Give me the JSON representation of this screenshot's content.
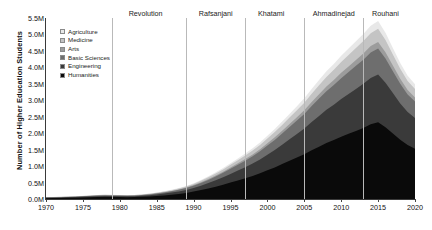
{
  "chart_data": {
    "type": "area",
    "stacked": true,
    "title": "",
    "xlabel": "",
    "ylabel": "Number of Higher Education Students",
    "xlim": [
      1970,
      2020
    ],
    "ylim": [
      0,
      5500000
    ],
    "ytick_labels": [
      "0.0M",
      "0.5M",
      "1.0M",
      "1.5M",
      "2.0M",
      "2.5M",
      "3.0M",
      "3.5M",
      "4.0M",
      "4.5M",
      "5.0M",
      "5.5M"
    ],
    "ytick_values": [
      0,
      500000,
      1000000,
      1500000,
      2000000,
      2500000,
      3000000,
      3500000,
      4000000,
      4500000,
      5000000,
      5500000
    ],
    "xtick_labels": [
      "1970",
      "1975",
      "1980",
      "1985",
      "1990",
      "1995",
      "2000",
      "2005",
      "2010",
      "2015",
      "2020"
    ],
    "xtick_values": [
      1970,
      1975,
      1980,
      1985,
      1990,
      1995,
      2000,
      2005,
      2010,
      2015,
      2020
    ],
    "grid": false,
    "legend_position": "upper-left",
    "x": [
      1970,
      1971,
      1972,
      1973,
      1974,
      1975,
      1976,
      1977,
      1978,
      1979,
      1980,
      1981,
      1982,
      1983,
      1984,
      1985,
      1986,
      1987,
      1988,
      1989,
      1990,
      1991,
      1992,
      1993,
      1994,
      1995,
      1996,
      1997,
      1998,
      1999,
      2000,
      2001,
      2002,
      2003,
      2004,
      2005,
      2006,
      2007,
      2008,
      2009,
      2010,
      2011,
      2012,
      2013,
      2014,
      2015,
      2016,
      2017,
      2018,
      2019,
      2020
    ],
    "series": [
      {
        "name": "Humanities",
        "color": "#0a0a0a",
        "values": [
          25000,
          28000,
          32000,
          36000,
          41000,
          46000,
          52000,
          58000,
          62000,
          60000,
          58000,
          55000,
          58000,
          66000,
          78000,
          92000,
          110000,
          130000,
          155000,
          185000,
          225000,
          270000,
          320000,
          375000,
          435000,
          500000,
          565000,
          630000,
          700000,
          780000,
          870000,
          960000,
          1060000,
          1160000,
          1260000,
          1360000,
          1480000,
          1590000,
          1700000,
          1790000,
          1890000,
          1980000,
          2070000,
          2160000,
          2270000,
          2330000,
          2180000,
          1990000,
          1800000,
          1640000,
          1530000
        ]
      },
      {
        "name": "Engineering",
        "color": "#3a3a3a",
        "values": [
          12000,
          13000,
          15000,
          17000,
          19000,
          22000,
          25000,
          28000,
          30000,
          29000,
          28000,
          27000,
          28000,
          32000,
          38000,
          45000,
          54000,
          64000,
          76000,
          92000,
          112000,
          136000,
          163000,
          193000,
          226000,
          262000,
          299000,
          337000,
          378000,
          424000,
          476000,
          530000,
          590000,
          652000,
          716000,
          782000,
          860000,
          935000,
          1010000,
          1075000,
          1145000,
          1210000,
          1275000,
          1340000,
          1410000,
          1450000,
          1355000,
          1230000,
          1105000,
          1000000,
          930000
        ]
      },
      {
        "name": "Basic Sciences",
        "color": "#6e6e6e",
        "values": [
          8000,
          8500,
          9500,
          10500,
          12000,
          13500,
          15500,
          17500,
          18500,
          18000,
          17500,
          17000,
          17500,
          20000,
          23500,
          28000,
          33500,
          39500,
          47000,
          56000,
          68000,
          82000,
          98000,
          115000,
          134000,
          155000,
          176000,
          198000,
          221000,
          247000,
          276000,
          306000,
          339000,
          373000,
          408000,
          444000,
          486000,
          527000,
          566000,
          600000,
          637000,
          670000,
          703000,
          735000,
          770000,
          790000,
          735000,
          665000,
          595000,
          538000,
          500000
        ]
      },
      {
        "name": "Arts",
        "color": "#9c9c9c",
        "values": [
          2000,
          2200,
          2400,
          2700,
          3000,
          3400,
          3900,
          4400,
          4700,
          4600,
          4500,
          4400,
          4500,
          5100,
          6000,
          7100,
          8500,
          10000,
          12000,
          14300,
          17300,
          20800,
          24800,
          29200,
          34000,
          39300,
          44700,
          50200,
          56100,
          62600,
          70000,
          77600,
          85900,
          94600,
          103500,
          112600,
          123300,
          133700,
          143600,
          152200,
          161600,
          170000,
          178400,
          186500,
          195400,
          200400,
          186500,
          168700,
          151000,
          136500,
          127000
        ]
      },
      {
        "name": "Medicine",
        "color": "#c4c4c4",
        "values": [
          5000,
          5400,
          5900,
          6500,
          7200,
          8000,
          9000,
          10000,
          10500,
          10200,
          9900,
          9600,
          9900,
          11200,
          13100,
          15400,
          18400,
          21600,
          25700,
          30600,
          36800,
          44100,
          52300,
          61300,
          71200,
          82000,
          93000,
          104200,
          116000,
          129200,
          144000,
          159300,
          176000,
          193400,
          211200,
          229300,
          250600,
          271300,
          291200,
          308200,
          326800,
          343500,
          360000,
          376200,
          393900,
          403700,
          375700,
          339600,
          303700,
          274300,
          255000
        ]
      },
      {
        "name": "Agriculture",
        "color": "#e8e8e8",
        "values": [
          3000,
          3200,
          3500,
          3900,
          4300,
          4800,
          5400,
          6000,
          6400,
          6200,
          6000,
          5800,
          6000,
          6800,
          7900,
          9300,
          11100,
          13000,
          15400,
          18300,
          22000,
          26300,
          31100,
          36400,
          42200,
          48600,
          55000,
          61600,
          68400,
          76100,
          84700,
          93500,
          103200,
          113200,
          123400,
          133800,
          146000,
          157900,
          169300,
          179000,
          189600,
          199100,
          208400,
          217400,
          227500,
          233000,
          216700,
          195700,
          174800,
          157800,
          146500
        ]
      }
    ],
    "eras": [
      {
        "label": "Revolution",
        "line_year": 1979,
        "label_year": 1983.5
      },
      {
        "label": "Rafsanjani",
        "line_year": 1989,
        "label_year": 1993
      },
      {
        "label": "Khatami",
        "line_year": 1997,
        "label_year": 2000.5
      },
      {
        "label": "Ahmadinejad",
        "line_year": 2005,
        "label_year": 2009
      },
      {
        "label": "Rouhani",
        "line_year": 2013,
        "label_year": 2016
      }
    ]
  }
}
